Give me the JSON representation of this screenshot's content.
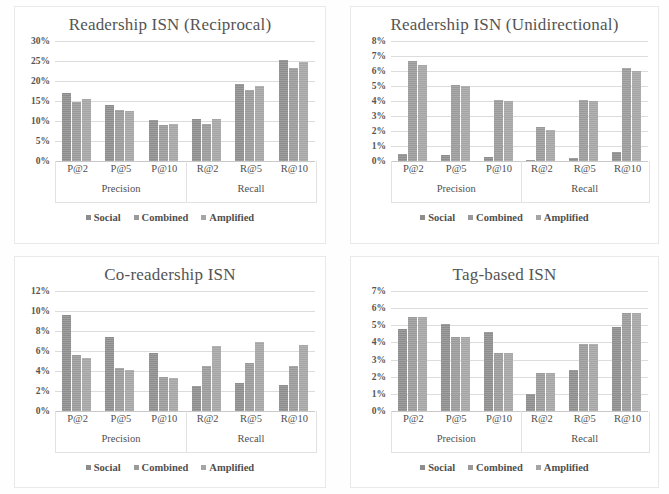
{
  "figure": {
    "panel_count": 4,
    "series_names": [
      "Social",
      "Combined",
      "Amplified"
    ],
    "series_colors": [
      "#8d8d8d",
      "#9a9a9a",
      "#a5a5a5"
    ],
    "categories": [
      "P@2",
      "P@5",
      "P@10",
      "R@2",
      "R@5",
      "R@10"
    ],
    "group_labels": [
      "Precision",
      "Recall"
    ]
  },
  "chart_data": [
    {
      "type": "bar",
      "title": "Readership ISN (Reciprocal)",
      "xlabel": "",
      "ylabel": "",
      "categories": [
        "P@2",
        "P@5",
        "P@10",
        "R@2",
        "R@5",
        "R@10"
      ],
      "group_labels": [
        "Precision",
        "Recall"
      ],
      "series": [
        {
          "name": "Social",
          "values": [
            17.0,
            14.0,
            10.2,
            10.5,
            19.2,
            25.2
          ]
        },
        {
          "name": "Combined",
          "values": [
            14.7,
            12.7,
            8.9,
            9.2,
            17.8,
            23.3
          ]
        },
        {
          "name": "Amplified",
          "values": [
            15.4,
            12.6,
            9.3,
            10.4,
            18.8,
            24.8
          ]
        }
      ],
      "ylim": [
        0,
        30
      ],
      "ytick_step": 5,
      "yticks": [
        "0%",
        "5%",
        "10%",
        "15%",
        "20%",
        "25%",
        "30%"
      ],
      "grid": true,
      "legend_position": "bottom"
    },
    {
      "type": "bar",
      "title": "Readership ISN (Unidirectional)",
      "xlabel": "",
      "ylabel": "",
      "categories": [
        "P@2",
        "P@5",
        "P@10",
        "R@2",
        "R@5",
        "R@10"
      ],
      "group_labels": [
        "Precision",
        "Recall"
      ],
      "series": [
        {
          "name": "Social",
          "values": [
            0.5,
            0.4,
            0.3,
            0.1,
            0.2,
            0.6
          ]
        },
        {
          "name": "Combined",
          "values": [
            6.7,
            5.1,
            4.1,
            2.3,
            4.1,
            6.2
          ]
        },
        {
          "name": "Amplified",
          "values": [
            6.4,
            5.0,
            4.0,
            2.1,
            4.0,
            6.0
          ]
        }
      ],
      "ylim": [
        0,
        8
      ],
      "ytick_step": 1,
      "yticks": [
        "0%",
        "1%",
        "2%",
        "3%",
        "4%",
        "5%",
        "6%",
        "7%",
        "8%"
      ],
      "grid": true,
      "legend_position": "bottom"
    },
    {
      "type": "bar",
      "title": "Co-readership ISN",
      "xlabel": "",
      "ylabel": "",
      "categories": [
        "P@2",
        "P@5",
        "P@10",
        "R@2",
        "R@5",
        "R@10"
      ],
      "group_labels": [
        "Precision",
        "Recall"
      ],
      "series": [
        {
          "name": "Social",
          "values": [
            9.6,
            7.4,
            5.8,
            2.5,
            2.8,
            2.6
          ]
        },
        {
          "name": "Combined",
          "values": [
            5.6,
            4.3,
            3.4,
            4.5,
            4.8,
            4.5
          ]
        },
        {
          "name": "Amplified",
          "values": [
            5.3,
            4.1,
            3.3,
            6.5,
            6.9,
            6.6
          ]
        }
      ],
      "ylim": [
        0,
        12
      ],
      "ytick_step": 2,
      "yticks": [
        "0%",
        "2%",
        "4%",
        "6%",
        "8%",
        "10%",
        "12%"
      ],
      "grid": true,
      "legend_position": "bottom"
    },
    {
      "type": "bar",
      "title": "Tag-based ISN",
      "xlabel": "",
      "ylabel": "",
      "categories": [
        "P@2",
        "P@5",
        "P@10",
        "R@2",
        "R@5",
        "R@10"
      ],
      "group_labels": [
        "Precision",
        "Recall"
      ],
      "series": [
        {
          "name": "Social",
          "values": [
            4.8,
            5.1,
            4.6,
            1.0,
            2.4,
            4.9
          ]
        },
        {
          "name": "Combined",
          "values": [
            5.5,
            4.3,
            3.4,
            2.2,
            3.9,
            5.7
          ]
        },
        {
          "name": "Amplified",
          "values": [
            5.5,
            4.3,
            3.4,
            2.2,
            3.9,
            5.7
          ]
        }
      ],
      "ylim": [
        0,
        7
      ],
      "ytick_step": 1,
      "yticks": [
        "0%",
        "1%",
        "2%",
        "3%",
        "4%",
        "5%",
        "6%",
        "7%"
      ],
      "grid": true,
      "legend_position": "bottom"
    }
  ]
}
